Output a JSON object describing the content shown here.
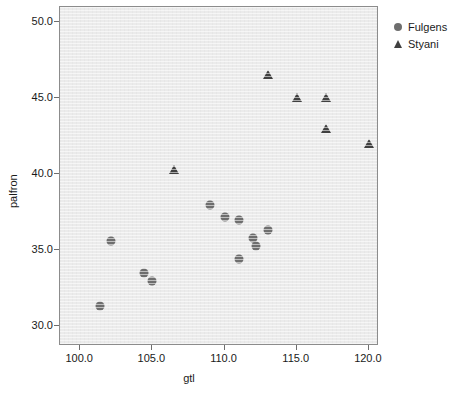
{
  "chart_data": {
    "type": "scatter",
    "title": "",
    "xlabel": "gtl",
    "ylabel": "palfron",
    "xlim": [
      98.6,
      120.7
    ],
    "ylim": [
      28.7,
      51.0
    ],
    "xticks": [
      100.0,
      105.0,
      110.0,
      115.0,
      120.0
    ],
    "yticks": [
      30.0,
      35.0,
      40.0,
      45.0,
      50.0
    ],
    "xtick_labels": [
      "100.0",
      "105.0",
      "110.0",
      "115.0",
      "120.0"
    ],
    "ytick_labels": [
      "30.0",
      "35.0",
      "40.0",
      "45.0",
      "50.0"
    ],
    "grid": false,
    "legend_position": "outside-top-right",
    "panel_background": "#ebebeb",
    "series": [
      {
        "name": "Fulgens",
        "marker": "circle",
        "color": "#6e6e6e",
        "points": [
          {
            "x": 101.4,
            "y": 31.3
          },
          {
            "x": 102.1,
            "y": 35.6
          },
          {
            "x": 104.4,
            "y": 33.5
          },
          {
            "x": 105.0,
            "y": 33.0
          },
          {
            "x": 109.0,
            "y": 38.0
          },
          {
            "x": 110.0,
            "y": 37.2
          },
          {
            "x": 111.0,
            "y": 37.0
          },
          {
            "x": 111.0,
            "y": 34.4
          },
          {
            "x": 112.0,
            "y": 35.8
          },
          {
            "x": 112.2,
            "y": 35.3
          },
          {
            "x": 113.0,
            "y": 36.3
          }
        ]
      },
      {
        "name": "Styani",
        "marker": "triangle",
        "color": "#404040",
        "points": [
          {
            "x": 106.5,
            "y": 40.3
          },
          {
            "x": 113.0,
            "y": 46.5
          },
          {
            "x": 115.0,
            "y": 45.0
          },
          {
            "x": 117.0,
            "y": 45.0
          },
          {
            "x": 117.0,
            "y": 43.0
          },
          {
            "x": 120.0,
            "y": 42.0
          }
        ]
      }
    ]
  },
  "legend": {
    "entries": [
      {
        "label": "Fulgens",
        "marker": "circle",
        "color": "#6e6e6e"
      },
      {
        "label": "Styani",
        "marker": "triangle",
        "color": "#404040"
      }
    ]
  }
}
